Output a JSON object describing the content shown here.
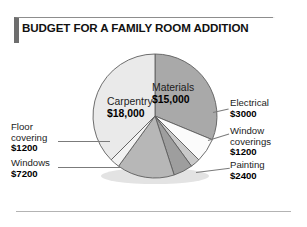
{
  "figure": {
    "title": "BUDGET FOR A FAMILY ROOM ADDITION",
    "accent_color": "#6e6e6e",
    "rule_color": "#b3b3b3"
  },
  "chart_data": {
    "type": "pie",
    "title": "BUDGET FOR A FAMILY ROOM ADDITION",
    "xlabel": "",
    "ylabel": "",
    "total": 48000,
    "currency": "$",
    "start_angle_deg": 0,
    "direction": "clockwise",
    "grid": false,
    "legend": "callout-labels",
    "categories": [
      "Materials",
      "Electrical",
      "Window coverings",
      "Painting",
      "Windows",
      "Floor covering",
      "Carpentry"
    ],
    "values": [
      15000,
      3000,
      1200,
      2400,
      7200,
      1200,
      18000
    ],
    "value_labels": [
      "$15,000",
      "$3000",
      "$1200",
      "$2400",
      "$7200",
      "$1200",
      "$18,000"
    ],
    "slice_colors": [
      "#a9a9a9",
      "#fbfbfb",
      "#c9c9c9",
      "#9e9e9e",
      "#b7b7b7",
      "#f2f2f2",
      "#eaeaea"
    ],
    "slices": [
      {
        "label": "Materials",
        "value": 15000,
        "value_label": "$15,000",
        "color": "#a9a9a9",
        "label_position": "inside"
      },
      {
        "label": "Electrical",
        "value": 3000,
        "value_label": "$3000",
        "color": "#fbfbfb",
        "label_position": "right"
      },
      {
        "label": "Window coverings",
        "value": 1200,
        "value_label": "$1200",
        "color": "#c9c9c9",
        "label_position": "right"
      },
      {
        "label": "Painting",
        "value": 2400,
        "value_label": "$2400",
        "color": "#9e9e9e",
        "label_position": "right"
      },
      {
        "label": "Windows",
        "value": 7200,
        "value_label": "$7200",
        "color": "#b7b7b7",
        "label_position": "left"
      },
      {
        "label": "Floor covering",
        "value": 1200,
        "value_label": "$1200",
        "color": "#f2f2f2",
        "label_position": "left"
      },
      {
        "label": "Carpentry",
        "value": 18000,
        "value_label": "$18,000",
        "color": "#eaeaea",
        "label_position": "inside"
      }
    ]
  },
  "labels": {
    "carpentry": {
      "cat": "Carpentry",
      "val": "$18,000"
    },
    "materials": {
      "cat": "Materials",
      "val": "$15,000"
    },
    "electrical": {
      "cat": "Electrical",
      "val": "$3000"
    },
    "window_coverings": {
      "cat_line1": "Window",
      "cat_line2": "coverings",
      "val": "$1200"
    },
    "painting": {
      "cat": "Painting",
      "val": "$2400"
    },
    "floor_covering": {
      "cat_line1": "Floor",
      "cat_line2": "covering",
      "val": "$1200"
    },
    "windows": {
      "cat": "Windows",
      "val": "$7200"
    }
  }
}
